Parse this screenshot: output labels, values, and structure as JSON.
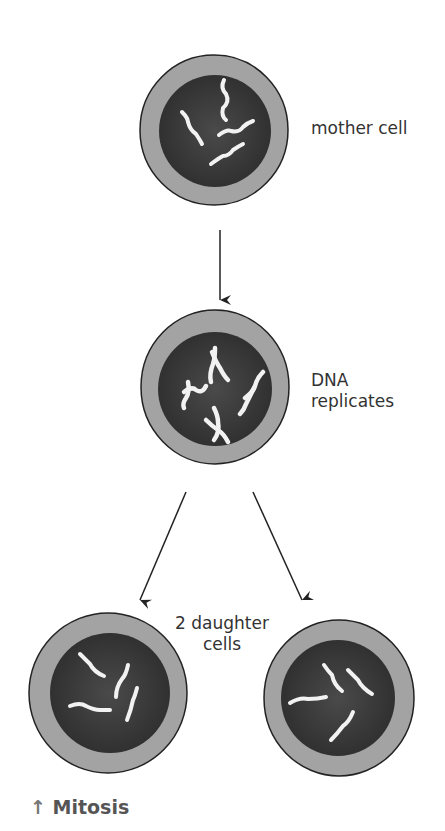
{
  "labels": {
    "mother_cell": "mother cell",
    "dna_line1": "DNA",
    "dna_line2": "replicates",
    "daughter_line1": "2 daughter",
    "daughter_line2": "cells"
  },
  "caption": {
    "arrow_icon": "↑",
    "text": "Mitosis"
  },
  "colors": {
    "cytoplasm": "#a3a3a3",
    "nucleus": "#3a3a3a",
    "chromosome": "#f2f2f2",
    "outline": "#222222",
    "arrow": "#222222"
  }
}
